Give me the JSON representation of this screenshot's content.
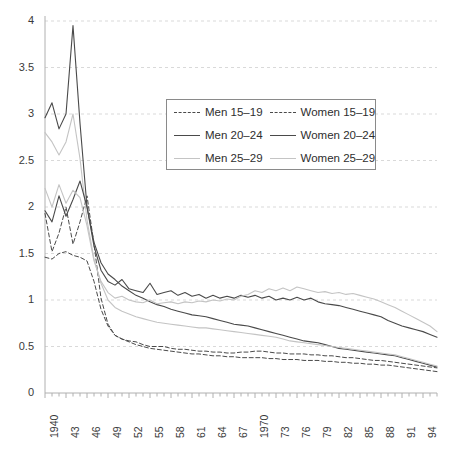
{
  "chart_data": {
    "type": "line",
    "title": "",
    "subtitle": "",
    "xlabel": "",
    "ylabel": "",
    "xlim": [
      1940,
      1996
    ],
    "ylim": [
      0,
      4
    ],
    "ytick_step": 0.5,
    "grid": "horizontal-dashed",
    "legend_position": "top-center-inside",
    "yticks": [
      "0",
      "0.5",
      "1",
      "1.5",
      "2",
      "2.5",
      "3",
      "3.5",
      "4"
    ],
    "ytick_values": [
      0,
      0.5,
      1,
      1.5,
      2,
      2.5,
      3,
      3.5,
      4
    ],
    "xticks": [
      "1940",
      "43",
      "46",
      "49",
      "52",
      "55",
      "58",
      "61",
      "64",
      "67",
      "1970",
      "73",
      "76",
      "79",
      "82",
      "85",
      "88",
      "91",
      "94"
    ],
    "xtick_values": [
      1940,
      1943,
      1946,
      1949,
      1952,
      1955,
      1958,
      1961,
      1964,
      1967,
      1970,
      1973,
      1976,
      1979,
      1982,
      1985,
      1988,
      1991,
      1994
    ],
    "x": [
      1940,
      1941,
      1942,
      1943,
      1944,
      1945,
      1946,
      1947,
      1948,
      1949,
      1950,
      1951,
      1952,
      1953,
      1954,
      1955,
      1956,
      1957,
      1958,
      1959,
      1960,
      1961,
      1962,
      1963,
      1964,
      1965,
      1966,
      1967,
      1968,
      1969,
      1970,
      1971,
      1972,
      1973,
      1974,
      1975,
      1976,
      1977,
      1978,
      1979,
      1980,
      1981,
      1982,
      1983,
      1984,
      1985,
      1986,
      1987,
      1988,
      1989,
      1990,
      1991,
      1992,
      1993,
      1994,
      1995,
      1996
    ],
    "colors": {
      "men_15_19": "#4a4a4a",
      "men_20_24": "#4a4a4a",
      "men_25_29": "#c4c4c4",
      "women_15_19": "#4a4a4a",
      "women_20_24": "#4a4a4a",
      "women_25_29": "#c4c4c4",
      "grid": "#d9d9d9",
      "axis": "#b0b0b0",
      "text": "#3a3a3a"
    },
    "series": [
      {
        "name": "Men 15–19",
        "key": "men_15_19",
        "color": "#4a4a4a",
        "style": "dashed",
        "width": 1.0,
        "values": [
          1.93,
          1.52,
          1.72,
          2.0,
          1.6,
          1.84,
          2.12,
          1.6,
          1.02,
          0.74,
          0.62,
          0.58,
          0.56,
          0.55,
          0.52,
          0.5,
          0.5,
          0.5,
          0.48,
          0.47,
          0.47,
          0.46,
          0.45,
          0.45,
          0.44,
          0.44,
          0.43,
          0.43,
          0.44,
          0.44,
          0.45,
          0.45,
          0.44,
          0.43,
          0.43,
          0.42,
          0.42,
          0.42,
          0.41,
          0.41,
          0.4,
          0.4,
          0.39,
          0.38,
          0.38,
          0.37,
          0.36,
          0.35,
          0.35,
          0.34,
          0.33,
          0.32,
          0.31,
          0.3,
          0.29,
          0.28,
          0.27
        ]
      },
      {
        "name": "Men 20–24",
        "key": "men_20_24",
        "color": "#4a4a4a",
        "style": "solid",
        "width": 1.1,
        "values": [
          2.96,
          3.12,
          2.84,
          3.0,
          3.95,
          2.9,
          2.0,
          1.62,
          1.4,
          1.28,
          1.22,
          1.15,
          1.1,
          1.05,
          1.02,
          0.98,
          0.95,
          0.93,
          0.9,
          0.88,
          0.86,
          0.84,
          0.83,
          0.82,
          0.8,
          0.78,
          0.76,
          0.74,
          0.73,
          0.72,
          0.7,
          0.68,
          0.66,
          0.64,
          0.62,
          0.6,
          0.58,
          0.56,
          0.55,
          0.54,
          0.52,
          0.5,
          0.48,
          0.47,
          0.46,
          0.45,
          0.44,
          0.43,
          0.42,
          0.41,
          0.4,
          0.38,
          0.36,
          0.34,
          0.32,
          0.3,
          0.28
        ]
      },
      {
        "name": "Men 25–29",
        "key": "men_25_29",
        "color": "#c4c4c4",
        "style": "solid",
        "width": 1.1,
        "values": [
          2.8,
          2.7,
          2.56,
          2.7,
          3.0,
          2.52,
          1.86,
          1.44,
          1.18,
          1.0,
          0.92,
          0.88,
          0.85,
          0.82,
          0.8,
          0.78,
          0.76,
          0.75,
          0.74,
          0.73,
          0.72,
          0.71,
          0.7,
          0.7,
          0.69,
          0.68,
          0.67,
          0.66,
          0.65,
          0.64,
          0.63,
          0.62,
          0.61,
          0.6,
          0.58,
          0.56,
          0.55,
          0.54,
          0.53,
          0.52,
          0.51,
          0.5,
          0.49,
          0.48,
          0.47,
          0.46,
          0.45,
          0.44,
          0.43,
          0.42,
          0.41,
          0.39,
          0.37,
          0.35,
          0.33,
          0.31,
          0.29
        ]
      },
      {
        "name": "Women 15–19",
        "key": "women_15_19",
        "color": "#4a4a4a",
        "style": "dashed",
        "width": 1.0,
        "values": [
          1.46,
          1.44,
          1.5,
          1.52,
          1.48,
          1.46,
          1.42,
          1.2,
          0.9,
          0.72,
          0.62,
          0.58,
          0.55,
          0.52,
          0.5,
          0.48,
          0.47,
          0.46,
          0.45,
          0.44,
          0.43,
          0.42,
          0.42,
          0.41,
          0.4,
          0.4,
          0.39,
          0.39,
          0.38,
          0.38,
          0.38,
          0.38,
          0.37,
          0.37,
          0.36,
          0.36,
          0.36,
          0.35,
          0.35,
          0.35,
          0.34,
          0.34,
          0.33,
          0.33,
          0.32,
          0.32,
          0.31,
          0.31,
          0.3,
          0.3,
          0.29,
          0.28,
          0.27,
          0.26,
          0.25,
          0.24,
          0.23
        ]
      },
      {
        "name": "Women 20–24",
        "key": "women_20_24",
        "color": "#4a4a4a",
        "style": "solid",
        "width": 1.1,
        "values": [
          1.96,
          1.84,
          2.12,
          1.9,
          2.08,
          2.28,
          2.0,
          1.58,
          1.32,
          1.2,
          1.16,
          1.22,
          1.12,
          1.1,
          1.08,
          1.18,
          1.06,
          1.08,
          1.1,
          1.05,
          1.08,
          1.04,
          1.06,
          1.02,
          1.05,
          1.02,
          1.04,
          1.02,
          1.05,
          1.03,
          1.05,
          1.02,
          1.04,
          1.0,
          1.02,
          1.0,
          1.03,
          1.0,
          1.02,
          0.98,
          0.96,
          0.95,
          0.94,
          0.92,
          0.9,
          0.88,
          0.86,
          0.84,
          0.82,
          0.78,
          0.75,
          0.72,
          0.7,
          0.68,
          0.66,
          0.63,
          0.6
        ]
      },
      {
        "name": "Women 25–29",
        "key": "women_25_29",
        "color": "#c4c4c4",
        "style": "solid",
        "width": 1.1,
        "values": [
          2.2,
          2.0,
          2.24,
          2.04,
          2.18,
          2.1,
          1.8,
          1.42,
          1.2,
          1.08,
          1.02,
          1.04,
          1.0,
          0.98,
          0.97,
          1.0,
          0.96,
          0.97,
          0.98,
          0.96,
          0.98,
          0.97,
          0.99,
          0.98,
          1.0,
          0.99,
          1.01,
          1.0,
          1.04,
          1.06,
          1.1,
          1.08,
          1.12,
          1.1,
          1.13,
          1.1,
          1.14,
          1.12,
          1.1,
          1.08,
          1.09,
          1.07,
          1.08,
          1.06,
          1.07,
          1.05,
          1.03,
          1.01,
          0.98,
          0.95,
          0.92,
          0.88,
          0.84,
          0.8,
          0.76,
          0.72,
          0.66
        ]
      }
    ],
    "legend": {
      "entries": [
        {
          "label": "Men 15–19",
          "style": "dashed",
          "color": "#4a4a4a",
          "swatch": "sw-dash-dark"
        },
        {
          "label": "Women 15–19",
          "style": "dashed",
          "color": "#4a4a4a",
          "swatch": "sw-dash-dark"
        },
        {
          "label": "Men 20–24",
          "style": "solid",
          "color": "#4a4a4a",
          "swatch": "sw-solid-dark"
        },
        {
          "label": "Women 20–24",
          "style": "solid",
          "color": "#4a4a4a",
          "swatch": "sw-solid-dark"
        },
        {
          "label": "Men 25–29",
          "style": "solid",
          "color": "#c4c4c4",
          "swatch": "sw-solid-light"
        },
        {
          "label": "Women 25–29",
          "style": "solid",
          "color": "#c4c4c4",
          "swatch": "sw-solid-light"
        }
      ]
    }
  }
}
